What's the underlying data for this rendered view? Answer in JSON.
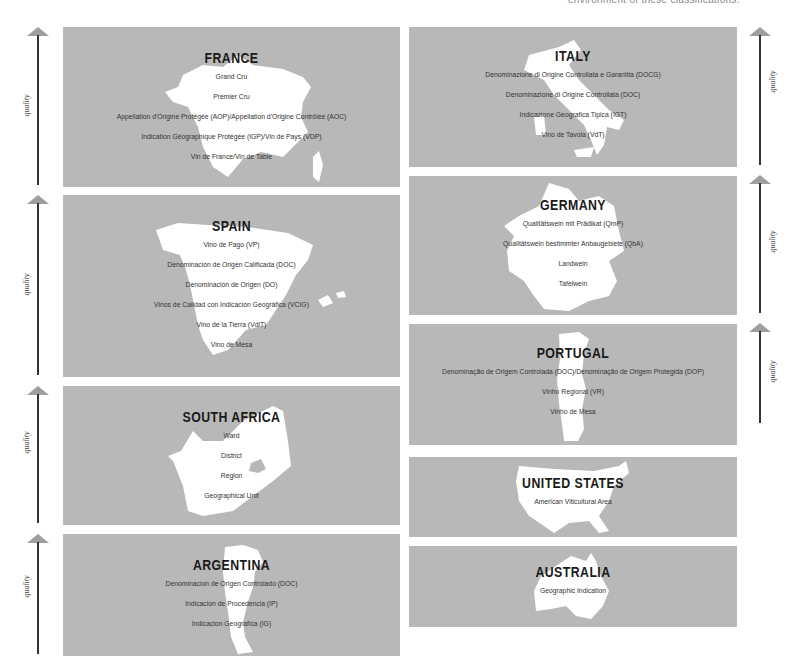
{
  "caption": "environment of these classifications.",
  "axis_label": "quality",
  "colors": {
    "panel": "#b8b8b8",
    "map": "#ffffff",
    "title": "#1a1a1a",
    "arrow_head": "#9e9e9e",
    "arrow_line": "#333333"
  },
  "countries": [
    {
      "name": "FRANCE",
      "tiers": [
        "Grand Cru",
        "Premier Cru",
        "Appellation d'Origine Protégée (AOP)/Appellation d'Origine Contrôlée (AOC)",
        "Indication Géographique Protégée (IGP)/Vin de Pays (VDP)",
        "Vin de France/Vin de Table"
      ]
    },
    {
      "name": "SPAIN",
      "tiers": [
        "Vino de Pago (VP)",
        "Denominación de Origen Calificada (DOC)",
        "Denominación de Origen (DO)",
        "Vinos de Calidad con Indicación Geográfica (VCIG)",
        "Vino de la Tierra (VdlT)",
        "Vino de Mesa"
      ]
    },
    {
      "name": "SOUTH AFRICA",
      "tiers": [
        "Ward",
        "District",
        "Region",
        "Geographical Unit"
      ]
    },
    {
      "name": "ARGENTINA",
      "tiers": [
        "Denominacion de Origen Controlado (DOC)",
        "Indicacion de Procedencia (IP)",
        "Indicacion Geografica (IG)"
      ]
    },
    {
      "name": "ITALY",
      "tiers": [
        "Denominazione di Origine Controllata e Garantita (DOCG)",
        "Denominazione di Origine Controllata (DOC)",
        "Indicazione Geografica Tipica (IGT)",
        "Vino de Tavola (VdT)"
      ]
    },
    {
      "name": "GERMANY",
      "tiers": [
        "Qualitätswein mit Prädikat (QmP)",
        "Qualitätswein bestimmter Anbaugebiete (QbA)",
        "Landwein",
        "Tafelwein"
      ]
    },
    {
      "name": "PORTUGAL",
      "tiers": [
        "Denominação de Origem Controlada (DOC)/Denominação de Origem Protegida (DOP)",
        "Vinho Regional (VR)",
        "Vinho de Mesa"
      ]
    },
    {
      "name": "UNITED STATES",
      "tiers": [
        "American Viticultural Area"
      ]
    },
    {
      "name": "AUSTRALIA",
      "tiers": [
        "Geographic Indication"
      ]
    }
  ]
}
